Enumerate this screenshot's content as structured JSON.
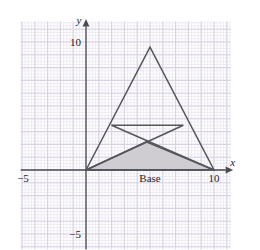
{
  "figure": {
    "axes": {
      "x_axis_name": "x",
      "y_axis_name": "y",
      "x_tick_labels": [
        {
          "value": -5,
          "text": "−5"
        },
        {
          "value": 10,
          "text": "10"
        }
      ],
      "y_tick_labels": [
        {
          "value": 10,
          "text": "10"
        },
        {
          "value": -5,
          "text": "−5"
        }
      ]
    },
    "annotations": [
      {
        "name": "base-label",
        "text": "Base",
        "x": 5,
        "y": -0.75
      }
    ],
    "colors": {
      "grid_minor": "#e9e5ef",
      "grid_major": "#d8d2e2",
      "axis": "#4a4a52",
      "shape_stroke": "#55555d",
      "shaded_fill": "#d0cdd2",
      "text": "#222228",
      "background": "#ffffff"
    }
  },
  "chart_data": {
    "type": "scatter",
    "xlabel": "x",
    "ylabel": "y",
    "xlim": [
      -5.1,
      11.3
    ],
    "ylim": [
      -6.2,
      11.6
    ],
    "grid": true,
    "grid_major_step": 1,
    "grid_minor_step": 0.25,
    "legend": "none",
    "units_per_major_gridline": 1,
    "series": [
      {
        "name": "main-triangle",
        "type": "polygon",
        "closed": true,
        "fill": "none",
        "points": [
          [
            0,
            0
          ],
          [
            5,
            9.6
          ],
          [
            10,
            0
          ]
        ]
      },
      {
        "name": "shaded-triangle",
        "type": "polygon",
        "closed": true,
        "fill": "#d0cdd2",
        "points": [
          [
            0,
            0
          ],
          [
            4.7,
            2.2
          ],
          [
            10,
            0
          ]
        ]
      },
      {
        "name": "cevian-left",
        "type": "line",
        "points": [
          [
            0,
            0
          ],
          [
            7.6,
            3.5
          ]
        ]
      },
      {
        "name": "cevian-right",
        "type": "line",
        "points": [
          [
            10,
            0
          ],
          [
            2.0,
            3.5
          ]
        ]
      },
      {
        "name": "crossbar",
        "type": "line",
        "points": [
          [
            2.0,
            3.5
          ],
          [
            7.6,
            3.5
          ]
        ]
      }
    ],
    "annotations": [
      {
        "text": "Base",
        "x": 5,
        "y": -0.75
      },
      {
        "text": "10",
        "x": 10,
        "y": -0.75
      },
      {
        "text": "−5",
        "x": -5,
        "y": -0.75
      },
      {
        "text": "10",
        "x": -0.6,
        "y": 10
      },
      {
        "text": "−5",
        "x": -0.6,
        "y": -5
      }
    ]
  }
}
